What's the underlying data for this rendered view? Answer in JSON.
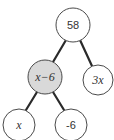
{
  "diagram": {
    "type": "number-tree",
    "colors": {
      "edge": "#2a2a2a",
      "node_stroke": "#4a4a4a",
      "node_fill": "#ffffff",
      "highlight_fill": "#d9d9d9",
      "text": "#333333"
    },
    "nodes": [
      {
        "id": "root",
        "label": "58",
        "highlighted": false,
        "italic": false
      },
      {
        "id": "left",
        "label": "x−6",
        "highlighted": true,
        "italic": true
      },
      {
        "id": "right",
        "label": "3x",
        "highlighted": false,
        "italic": true
      },
      {
        "id": "left-left",
        "label": "x",
        "highlighted": false,
        "italic": true
      },
      {
        "id": "left-right",
        "label": "-6",
        "highlighted": false,
        "italic": false
      }
    ],
    "edges": [
      {
        "from": "root",
        "to": "left"
      },
      {
        "from": "root",
        "to": "right"
      },
      {
        "from": "left",
        "to": "left-left"
      },
      {
        "from": "left",
        "to": "left-right"
      }
    ]
  }
}
